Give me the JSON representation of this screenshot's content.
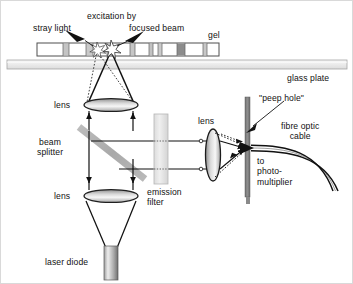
{
  "figure": {
    "type": "optical-schematic"
  },
  "labels": {
    "stray_light": "stray light",
    "excitation_by": "excitation by",
    "focused_beam": "focused beam",
    "gel": "gel",
    "glass_plate": "glass plate",
    "lens_top": "lens",
    "beam_splitter": "beam\nsplitter",
    "lens_bottom": "lens",
    "emission_filter": "emission\nfilter",
    "lens_right": "lens",
    "peep_hole": "\"peep hole\"",
    "fibre_optic_cable": "fibre optic\ncable",
    "to_photomultiplier": "to\nphoto-\nmultiplier",
    "laser_diode": "laser diode"
  },
  "colors": {
    "ink": "#111111",
    "line": "#1a1a1a",
    "glass_plate_fill": "#eeeeee",
    "glass_plate_stroke": "#9a9a9a",
    "gel_fill": "#ffffff",
    "gel_stroke": "#555555",
    "gel_band_light": "#c8c8c8",
    "gel_band_dark": "#8a8a8a",
    "beamsplitter": "#b5b5b5",
    "filter_fill": "#e2e2e2",
    "filter_stroke": "#b0b0b0",
    "peephole_bar": "#7c7c7c",
    "laser_body_light": "#e6e6e6",
    "laser_body_dark": "#7a7a7a",
    "lens_light": "#f2f2f2",
    "lens_dark": "#9a9a9a"
  },
  "components": {
    "gel": {
      "x": 36,
      "y": 42,
      "width": 182,
      "height": 13,
      "bands": [
        {
          "x": 36,
          "w": 26,
          "tone": "empty"
        },
        {
          "x": 62,
          "w": 6,
          "tone": "light"
        },
        {
          "x": 68,
          "w": 17,
          "tone": "empty"
        },
        {
          "x": 85,
          "w": 7,
          "tone": "light"
        },
        {
          "x": 92,
          "w": 14,
          "tone": "empty"
        },
        {
          "x": 106,
          "w": 4,
          "tone": "light"
        },
        {
          "x": 110,
          "w": 19,
          "tone": "empty"
        },
        {
          "x": 129,
          "w": 5,
          "tone": "light"
        },
        {
          "x": 134,
          "w": 14,
          "tone": "empty"
        },
        {
          "x": 148,
          "w": 4,
          "tone": "light"
        },
        {
          "x": 152,
          "w": 5,
          "tone": "empty"
        },
        {
          "x": 157,
          "w": 4,
          "tone": "light"
        },
        {
          "x": 161,
          "w": 15,
          "tone": "empty"
        },
        {
          "x": 176,
          "w": 8,
          "tone": "dark"
        },
        {
          "x": 184,
          "w": 18,
          "tone": "empty"
        },
        {
          "x": 202,
          "w": 4,
          "tone": "light"
        },
        {
          "x": 206,
          "w": 12,
          "tone": "empty"
        }
      ]
    },
    "glass_plate": {
      "x": 6,
      "y": 59,
      "width": 340,
      "height": 9
    },
    "lens_top": {
      "cx": 110,
      "cy": 104,
      "rx": 27,
      "ry": 6.5
    },
    "lens_bottom": {
      "cx": 110,
      "cy": 195,
      "rx": 27,
      "ry": 6.5
    },
    "lens_right": {
      "cx": 214,
      "cy": 147,
      "rx": 7.5,
      "ry": 26
    },
    "beam_splitter": {
      "x1": 80,
      "y1": 128,
      "x2": 142,
      "y2": 176,
      "thickness": 7
    },
    "emission_filter": {
      "x": 153,
      "y": 113,
      "width": 14,
      "height": 70
    },
    "peep_hole_bar": {
      "x": 244,
      "y": 96,
      "width": 5,
      "height": 100
    },
    "laser_diode": {
      "x": 103,
      "y": 245,
      "width": 14,
      "height": 34
    },
    "excitation_spot": {
      "x": 110,
      "y": 48
    },
    "stray_spot": {
      "x": 96,
      "y": 48
    },
    "detector_focus": {
      "x": 246,
      "y": 147
    }
  },
  "label_positions": {
    "stray_light": {
      "x": 32,
      "y": 22
    },
    "excitation_by": {
      "x": 86,
      "y": 10
    },
    "focused_beam": {
      "x": 128,
      "y": 22
    },
    "gel": {
      "x": 207,
      "y": 29
    },
    "glass_plate": {
      "x": 288,
      "y": 73
    },
    "lens_top": {
      "x": 52,
      "y": 99
    },
    "beam_splitter": {
      "x": 36,
      "y": 136
    },
    "lens_bottom": {
      "x": 52,
      "y": 190
    },
    "emission_filter": {
      "x": 146,
      "y": 186
    },
    "lens_right": {
      "x": 196,
      "y": 115
    },
    "peep_hole": {
      "x": 258,
      "y": 92
    },
    "fibre_optic_cable": {
      "x": 280,
      "y": 122
    },
    "to_photomultiplier": {
      "x": 256,
      "y": 156
    },
    "laser_diode": {
      "x": 44,
      "y": 256
    }
  }
}
